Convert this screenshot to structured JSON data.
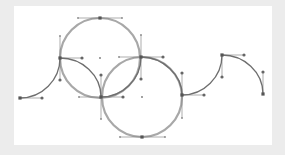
{
  "diagram": {
    "title": "",
    "colors": {
      "page_bg": "#ececec",
      "canvas_bg": "#ffffff",
      "circle_stroke": "#a8a8a8",
      "curve_stroke": "#6e6e6e",
      "handle": "#666666"
    },
    "canvas": {
      "x": 14,
      "y": 6,
      "width": 258,
      "height": 139
    },
    "circles": [
      {
        "id": "circle-1",
        "cx": 100,
        "cy": 58,
        "r": 40
      },
      {
        "id": "circle-2",
        "cx": 142,
        "cy": 97,
        "r": 40
      }
    ],
    "curves": [
      {
        "id": "left-rise",
        "d": "M20 98 C42 98 60 80 60 58"
      },
      {
        "id": "petal-1",
        "d": "M60 58 C82 58 101 75 101 97"
      },
      {
        "id": "inner-arc-1",
        "d": "M101 97 C123 97 141 79 141 57"
      },
      {
        "id": "inner-arc-2",
        "d": "M141 57 C163 57 182 75 182 95"
      },
      {
        "id": "right-rise",
        "d": "M182 95 C204 95 222 77 222 55"
      },
      {
        "id": "right-fall",
        "d": "M222 55 C244 55 263 72 263 94"
      }
    ],
    "handles": [
      {
        "x1": 20,
        "y1": 98,
        "x2": 42,
        "y2": 98
      },
      {
        "x1": 60,
        "y1": 58,
        "x2": 60,
        "y2": 80
      },
      {
        "x1": 60,
        "y1": 58,
        "x2": 82,
        "y2": 58
      },
      {
        "x1": 60,
        "y1": 58,
        "x2": 60,
        "y2": 36
      },
      {
        "x1": 101,
        "y1": 97,
        "x2": 101,
        "y2": 75
      },
      {
        "x1": 101,
        "y1": 97,
        "x2": 123,
        "y2": 97
      },
      {
        "x1": 101,
        "y1": 97,
        "x2": 79,
        "y2": 97
      },
      {
        "x1": 101,
        "y1": 97,
        "x2": 101,
        "y2": 119
      },
      {
        "x1": 78,
        "y1": 18,
        "x2": 122,
        "y2": 18
      },
      {
        "x1": 141,
        "y1": 57,
        "x2": 141,
        "y2": 79
      },
      {
        "x1": 141,
        "y1": 57,
        "x2": 141,
        "y2": 35
      },
      {
        "x1": 119,
        "y1": 57,
        "x2": 163,
        "y2": 57
      },
      {
        "x1": 182,
        "y1": 95,
        "x2": 182,
        "y2": 73
      },
      {
        "x1": 182,
        "y1": 95,
        "x2": 182,
        "y2": 118
      },
      {
        "x1": 182,
        "y1": 95,
        "x2": 204,
        "y2": 95
      },
      {
        "x1": 120,
        "y1": 137,
        "x2": 165,
        "y2": 137
      },
      {
        "x1": 222,
        "y1": 55,
        "x2": 222,
        "y2": 77
      },
      {
        "x1": 222,
        "y1": 55,
        "x2": 244,
        "y2": 55
      },
      {
        "x1": 263,
        "y1": 94,
        "x2": 263,
        "y2": 72
      }
    ],
    "anchors": [
      {
        "x": 20,
        "y": 98
      },
      {
        "x": 60,
        "y": 58
      },
      {
        "x": 101,
        "y": 97
      },
      {
        "x": 141,
        "y": 57
      },
      {
        "x": 182,
        "y": 95
      },
      {
        "x": 222,
        "y": 55
      },
      {
        "x": 263,
        "y": 94
      },
      {
        "x": 100,
        "y": 18
      },
      {
        "x": 142,
        "y": 137
      }
    ],
    "handle_points": [
      {
        "x": 42,
        "y": 98
      },
      {
        "x": 60,
        "y": 80
      },
      {
        "x": 82,
        "y": 58
      },
      {
        "x": 101,
        "y": 75
      },
      {
        "x": 123,
        "y": 97
      },
      {
        "x": 141,
        "y": 79
      },
      {
        "x": 163,
        "y": 57
      },
      {
        "x": 182,
        "y": 73
      },
      {
        "x": 204,
        "y": 95
      },
      {
        "x": 222,
        "y": 77
      },
      {
        "x": 244,
        "y": 55
      },
      {
        "x": 263,
        "y": 72
      }
    ],
    "small_points": [
      {
        "x": 60,
        "y": 36
      },
      {
        "x": 78,
        "y": 18
      },
      {
        "x": 122,
        "y": 18
      },
      {
        "x": 141,
        "y": 35
      },
      {
        "x": 119,
        "y": 57
      },
      {
        "x": 79,
        "y": 97
      },
      {
        "x": 101,
        "y": 119
      },
      {
        "x": 182,
        "y": 118
      },
      {
        "x": 120,
        "y": 137
      },
      {
        "x": 165,
        "y": 137
      }
    ],
    "centers": [
      {
        "x": 100,
        "y": 58
      },
      {
        "x": 142,
        "y": 97
      }
    ]
  }
}
